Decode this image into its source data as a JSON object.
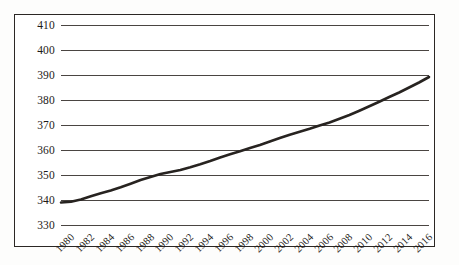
{
  "chart_data": {
    "type": "line",
    "title": "",
    "subtitle": "",
    "xlabel": "",
    "ylabel": "",
    "grid": true,
    "legend": false,
    "legend_position": "none",
    "ylim": [
      330,
      410
    ],
    "yticks": [
      330,
      340,
      350,
      360,
      370,
      380,
      390,
      400,
      410
    ],
    "ytick_labels": [
      "330",
      "340",
      "350",
      "360",
      "370",
      "380",
      "390",
      "400",
      "410"
    ],
    "xlim": [
      1980,
      2017
    ],
    "xticks": [
      1980,
      1982,
      1984,
      1986,
      1988,
      1990,
      1992,
      1994,
      1996,
      1998,
      2000,
      2002,
      2004,
      2006,
      2008,
      2010,
      2012,
      2014,
      2016
    ],
    "xtick_labels": [
      "1980",
      "1982",
      "1984",
      "1986",
      "1988",
      "1990",
      "1992",
      "1994",
      "1996",
      "1998",
      "2000",
      "2002",
      "2004",
      "2006",
      "2008",
      "2010",
      "2012",
      "2014",
      "2016"
    ],
    "series": [
      {
        "name": "series-1",
        "color": "#272320",
        "line_width": 2.6,
        "x": [
          1980,
          1981,
          1982,
          1983,
          1984,
          1985,
          1986,
          1987,
          1988,
          1989,
          1990,
          1991,
          1992,
          1993,
          1994,
          1995,
          1996,
          1997,
          1998,
          1999,
          2000,
          2001,
          2002,
          2003,
          2004,
          2005,
          2006,
          2007,
          2008,
          2009,
          2010,
          2011,
          2012,
          2013,
          2014,
          2015,
          2016,
          2017
        ],
        "values": [
          339.0,
          339.3,
          340.2,
          341.5,
          342.7,
          343.8,
          345.1,
          346.5,
          348.0,
          349.2,
          350.4,
          351.2,
          352.0,
          353.1,
          354.3,
          355.6,
          357.0,
          358.3,
          359.5,
          360.8,
          362.0,
          363.4,
          364.8,
          366.1,
          367.3,
          368.5,
          369.8,
          371.0,
          372.5,
          374.0,
          375.7,
          377.5,
          379.3,
          381.2,
          383.0,
          385.0,
          387.0,
          389.2
        ]
      }
    ]
  },
  "axis": {
    "y_tick_values": [
      410,
      400,
      390,
      380,
      370,
      360,
      350,
      340,
      330
    ],
    "x_tick_values": [
      "1980",
      "1982",
      "1984",
      "1986",
      "1988",
      "1990",
      "1992",
      "1994",
      "1996",
      "1998",
      "2000",
      "2002",
      "2004",
      "2006",
      "2008",
      "2010",
      "2012",
      "2014",
      "2016"
    ]
  },
  "style": {
    "line_color": "#272320",
    "grid_color": "#4a4542",
    "frame_color": "#2b2724",
    "text_color": "#1d1a18",
    "background": "#ffffff"
  }
}
